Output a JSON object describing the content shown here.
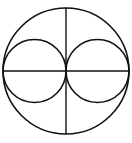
{
  "diagram": {
    "stroke_color": "#111111",
    "background_color": "#ffffff",
    "shapes": [
      {
        "name": "outer-circle",
        "type": "circle"
      },
      {
        "name": "left-inner-circle",
        "type": "circle"
      },
      {
        "name": "right-inner-circle",
        "type": "circle"
      },
      {
        "name": "horizontal-diameter",
        "type": "line"
      },
      {
        "name": "vertical-diameter",
        "type": "line"
      }
    ]
  }
}
